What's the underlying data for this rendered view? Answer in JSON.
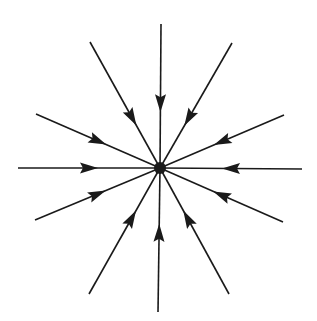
{
  "diagram": {
    "stroke_color": "#1a1a1a",
    "background": "#ffffff",
    "center": [
      160,
      168
    ],
    "center_radius": 6,
    "lines": [
      {
        "name": "line-top",
        "start": [
          161,
          24
        ],
        "arrow_at": 0.55
      },
      {
        "name": "line-top-right",
        "start": [
          232,
          43
        ],
        "arrow_at": 0.6
      },
      {
        "name": "line-upper-right",
        "start": [
          284,
          115
        ],
        "arrow_at": 0.5
      },
      {
        "name": "line-right",
        "start": [
          302,
          169
        ],
        "arrow_at": 0.5
      },
      {
        "name": "line-lower-right",
        "start": [
          283,
          222
        ],
        "arrow_at": 0.5
      },
      {
        "name": "line-bottom-right",
        "start": [
          229,
          294
        ],
        "arrow_at": 0.6
      },
      {
        "name": "line-bottom",
        "start": [
          158,
          312
        ],
        "arrow_at": 0.55
      },
      {
        "name": "line-bottom-left",
        "start": [
          89,
          294
        ],
        "arrow_at": 0.6
      },
      {
        "name": "line-lower-left",
        "start": [
          35,
          220
        ],
        "arrow_at": 0.5
      },
      {
        "name": "line-left",
        "start": [
          18,
          168
        ],
        "arrow_at": 0.5
      },
      {
        "name": "line-upper-left",
        "start": [
          36,
          114
        ],
        "arrow_at": 0.5
      },
      {
        "name": "line-top-left",
        "start": [
          90,
          42
        ],
        "arrow_at": 0.6
      }
    ]
  }
}
